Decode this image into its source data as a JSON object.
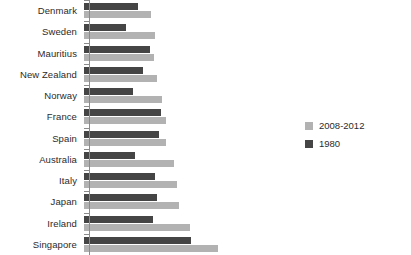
{
  "chart_data": {
    "type": "bar",
    "orientation": "horizontal",
    "title": "",
    "xlabel": "",
    "ylabel": "",
    "grid": false,
    "legend_position": "right",
    "axis_tick_labels": [],
    "categories": [
      "Denmark",
      "Sweden",
      "Mauritius",
      "New Zealand",
      "Norway",
      "France",
      "Spain",
      "Australia",
      "Italy",
      "Japan",
      "Ireland",
      "Singapore"
    ],
    "series": [
      {
        "name": "1980",
        "color": "#454545",
        "values": [
          54,
          42,
          66,
          59,
          49,
          78,
          76,
          51,
          72,
          74,
          69,
          108
        ]
      },
      {
        "name": "2008-2012",
        "color": "#b2b2b2",
        "values": [
          67,
          72,
          71,
          74,
          79,
          83,
          83,
          91,
          94,
          96,
          107,
          135
        ]
      }
    ],
    "xlim": [
      0,
      140
    ]
  },
  "legend": {
    "items": [
      {
        "label": "2008-2012",
        "color": "#b2b2b2"
      },
      {
        "label": "1980",
        "color": "#454545"
      }
    ]
  }
}
